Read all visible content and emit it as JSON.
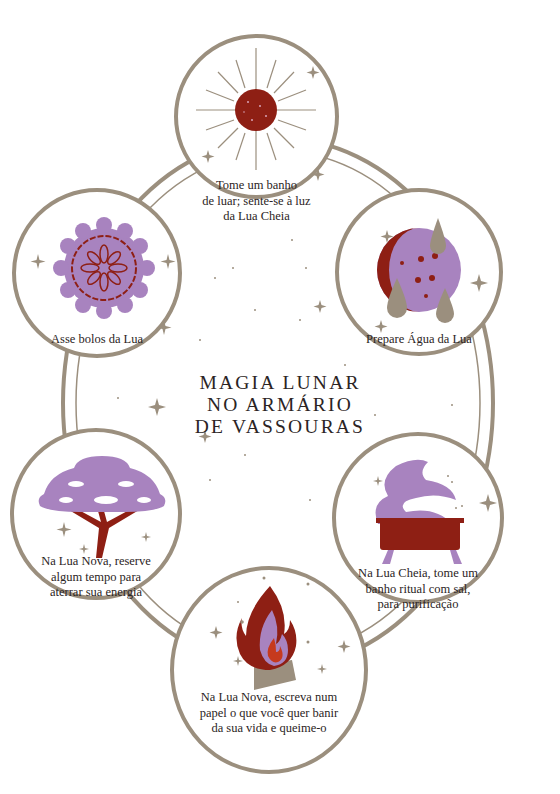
{
  "title": {
    "line1": "MAGIA LUNAR",
    "line2": "NO ARMÁRIO",
    "line3": "DE VASSOURAS"
  },
  "colors": {
    "ring": "#9b8f7e",
    "lavender": "#a883bf",
    "dark_red": "#8e1f14",
    "taupe": "#9b8f7e",
    "text": "#2b2424"
  },
  "nodes": [
    {
      "id": "top",
      "icon": "sun-moon-icon",
      "lines": [
        "Tome um banho",
        "de luar; sente-se à luz",
        "da Lua Cheia"
      ]
    },
    {
      "id": "upper-right",
      "icon": "moon-water-icon",
      "lines": [
        "Prepare Água da Lua"
      ]
    },
    {
      "id": "lower-right",
      "icon": "bathtub-icon",
      "lines": [
        "Na Lua Cheia, tome um",
        "banho ritual com sal,",
        "para purificação"
      ]
    },
    {
      "id": "bottom",
      "icon": "fire-icon",
      "lines": [
        "Na Lua Nova, escreva num",
        "papel o que você quer banir",
        "da sua vida e queime-o"
      ]
    },
    {
      "id": "lower-left",
      "icon": "tree-icon",
      "lines": [
        "Na Lua Nova, reserve",
        "algum tempo para",
        "aterrar sua energia"
      ]
    },
    {
      "id": "upper-left",
      "icon": "mooncake-icon",
      "lines": [
        "Asse bolos da Lua"
      ]
    }
  ]
}
